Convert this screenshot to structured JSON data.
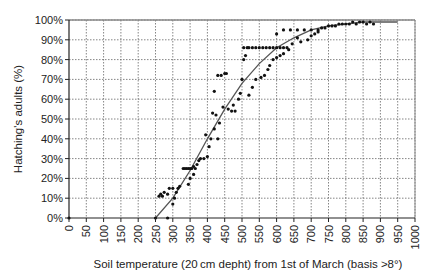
{
  "chart_data": {
    "type": "scatter",
    "title": "",
    "xlabel": "Soil temperature (20 cm depht) from 1st of March (basis >8°)",
    "ylabel": "Hatching's adults (%)",
    "xlim": [
      0,
      1000
    ],
    "ylim": [
      0,
      100
    ],
    "x_ticks": [
      "0",
      "50",
      "100",
      "150",
      "200",
      "250",
      "300",
      "350",
      "400",
      "450",
      "500",
      "550",
      "600",
      "650",
      "700",
      "750",
      "800",
      "850",
      "900",
      "950",
      "1000"
    ],
    "y_ticks": [
      "0%",
      "10%",
      "20%",
      "30%",
      "40%",
      "50%",
      "60%",
      "70%",
      "80%",
      "90%",
      "100%"
    ],
    "grid": true,
    "legend": null,
    "series": [
      {
        "name": "observed",
        "kind": "scatter",
        "points": [
          [
            0,
            0
          ],
          [
            250,
            0
          ],
          [
            285,
            0
          ],
          [
            260,
            11
          ],
          [
            265,
            12
          ],
          [
            270,
            11
          ],
          [
            275,
            13
          ],
          [
            285,
            12
          ],
          [
            290,
            15
          ],
          [
            300,
            15
          ],
          [
            305,
            10
          ],
          [
            310,
            13
          ],
          [
            315,
            15
          ],
          [
            320,
            16
          ],
          [
            300,
            7
          ],
          [
            330,
            25
          ],
          [
            335,
            25
          ],
          [
            340,
            25
          ],
          [
            345,
            25
          ],
          [
            350,
            25
          ],
          [
            355,
            25
          ],
          [
            360,
            26
          ],
          [
            365,
            25
          ],
          [
            350,
            20
          ],
          [
            345,
            17
          ],
          [
            360,
            22
          ],
          [
            370,
            27
          ],
          [
            375,
            29
          ],
          [
            380,
            30
          ],
          [
            390,
            30
          ],
          [
            400,
            31
          ],
          [
            405,
            36
          ],
          [
            395,
            42
          ],
          [
            410,
            40
          ],
          [
            420,
            45
          ],
          [
            415,
            53
          ],
          [
            425,
            52
          ],
          [
            430,
            40
          ],
          [
            435,
            48
          ],
          [
            420,
            64
          ],
          [
            430,
            72
          ],
          [
            440,
            72
          ],
          [
            450,
            73
          ],
          [
            455,
            73
          ],
          [
            445,
            56
          ],
          [
            460,
            55
          ],
          [
            470,
            54
          ],
          [
            475,
            57
          ],
          [
            480,
            54
          ],
          [
            490,
            60
          ],
          [
            495,
            63
          ],
          [
            500,
            70
          ],
          [
            505,
            80
          ],
          [
            510,
            82
          ],
          [
            505,
            86
          ],
          [
            515,
            86
          ],
          [
            520,
            86
          ],
          [
            530,
            86
          ],
          [
            540,
            86
          ],
          [
            550,
            86
          ],
          [
            560,
            86
          ],
          [
            570,
            86
          ],
          [
            580,
            86
          ],
          [
            590,
            86
          ],
          [
            600,
            86
          ],
          [
            610,
            86
          ],
          [
            620,
            86
          ],
          [
            630,
            86
          ],
          [
            520,
            62
          ],
          [
            530,
            66
          ],
          [
            540,
            70
          ],
          [
            555,
            71
          ],
          [
            565,
            72
          ],
          [
            575,
            75
          ],
          [
            580,
            77
          ],
          [
            590,
            80
          ],
          [
            600,
            81
          ],
          [
            610,
            82
          ],
          [
            620,
            83
          ],
          [
            635,
            85
          ],
          [
            645,
            88
          ],
          [
            660,
            91
          ],
          [
            670,
            89
          ],
          [
            600,
            93
          ],
          [
            620,
            95
          ],
          [
            640,
            95
          ],
          [
            660,
            95
          ],
          [
            680,
            95
          ],
          [
            700,
            95
          ],
          [
            720,
            95
          ],
          [
            690,
            90
          ],
          [
            700,
            92
          ],
          [
            710,
            93
          ],
          [
            720,
            94
          ],
          [
            730,
            96
          ],
          [
            740,
            96
          ],
          [
            750,
            97
          ],
          [
            760,
            97
          ],
          [
            770,
            97
          ],
          [
            780,
            98
          ],
          [
            790,
            98
          ],
          [
            800,
            98
          ],
          [
            810,
            98
          ],
          [
            820,
            99
          ],
          [
            830,
            98
          ],
          [
            840,
            99
          ],
          [
            850,
            99
          ],
          [
            860,
            98
          ],
          [
            870,
            99
          ],
          [
            880,
            98
          ]
        ]
      },
      {
        "name": "fitted curve",
        "kind": "line",
        "points": [
          [
            250,
            0
          ],
          [
            300,
            10
          ],
          [
            350,
            24
          ],
          [
            400,
            40
          ],
          [
            450,
            55
          ],
          [
            500,
            68
          ],
          [
            550,
            78
          ],
          [
            600,
            86
          ],
          [
            650,
            91
          ],
          [
            700,
            95
          ],
          [
            750,
            97
          ],
          [
            800,
            98
          ],
          [
            850,
            99
          ],
          [
            900,
            99
          ],
          [
            950,
            99
          ]
        ]
      }
    ]
  }
}
